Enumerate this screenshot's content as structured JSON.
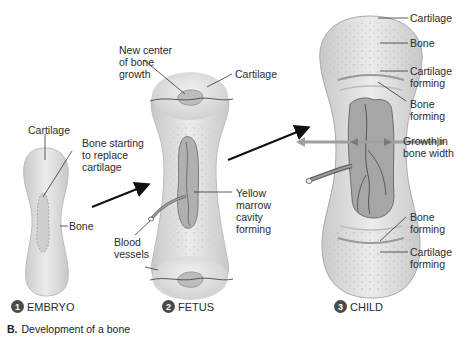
{
  "figure": {
    "caption_letter": "B.",
    "caption_text": "Development of a bone"
  },
  "stages": [
    {
      "number": "1",
      "name": "EMBRYO"
    },
    {
      "number": "2",
      "name": "FETUS"
    },
    {
      "number": "3",
      "name": "CHILD"
    }
  ],
  "embryo_labels": {
    "cartilage": "Cartilage",
    "bone_replace_1": "Bone starting",
    "bone_replace_2": "to replace",
    "bone_replace_3": "cartilage",
    "bone": "Bone"
  },
  "fetus_labels": {
    "new_center_1": "New center",
    "new_center_2": "of bone",
    "new_center_3": "growth",
    "cartilage": "Cartilage",
    "yellow_1": "Yellow",
    "yellow_2": "marrow",
    "yellow_3": "cavity",
    "yellow_4": "forming",
    "blood_1": "Blood",
    "blood_2": "vessels"
  },
  "child_labels": {
    "cartilage": "Cartilage",
    "bone": "Bone",
    "cart_forming_top_1": "Cartilage",
    "cart_forming_top_2": "forming",
    "bone_forming_top_1": "Bone",
    "bone_forming_top_2": "forming",
    "growth_1": "Growth in",
    "growth_2": "bone width",
    "bone_forming_bot_1": "Bone",
    "bone_forming_bot_2": "forming",
    "cart_forming_bot_1": "Cartilage",
    "cart_forming_bot_2": "forming"
  },
  "colors": {
    "cartilage_fill": "#e6e6e6",
    "bone_fill": "#d6d6d6",
    "marrow_fill": "#a8a8a8",
    "vessel": "#5a5a5a",
    "growth_arrow": "#a0a0a0",
    "stage_badge": "#4a4a4a"
  }
}
